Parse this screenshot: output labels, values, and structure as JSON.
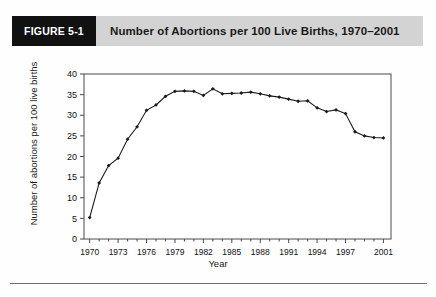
{
  "figure": {
    "tag": "FIGURE 5-1",
    "title": "Number of Abortions per 100 Live Births, 1970–2001",
    "tag_bg": "#111111",
    "banner_bg": "#d3d3d3"
  },
  "chart_data": {
    "type": "line",
    "title": "Number of Abortions per 100 Live Births, 1970–2001",
    "xlabel": "Year",
    "ylabel": "Number of abortions per 100 live births",
    "xlim": [
      1969.4,
      2001.8
    ],
    "ylim": [
      0,
      40
    ],
    "yticks": [
      0,
      5,
      10,
      15,
      20,
      25,
      30,
      35,
      40
    ],
    "ytick_labels": [
      "0",
      "5",
      "10",
      "15",
      "20",
      "25",
      "30",
      "35",
      "40"
    ],
    "xticks": [
      1970,
      1973,
      1976,
      1979,
      1982,
      1985,
      1988,
      1991,
      1994,
      1997,
      2001
    ],
    "xtick_labels": [
      "1970",
      "1973",
      "1976",
      "1979",
      "1982",
      "1985",
      "1988",
      "1991",
      "1994",
      "1997",
      "2001"
    ],
    "x_minor_tick_interval": 1,
    "grid": false,
    "legend": false,
    "marker": "diamond",
    "line_color": "#1a1a1a",
    "x": [
      1970,
      1971,
      1972,
      1973,
      1974,
      1975,
      1976,
      1977,
      1978,
      1979,
      1980,
      1981,
      1982,
      1983,
      1984,
      1985,
      1986,
      1987,
      1988,
      1989,
      1990,
      1991,
      1992,
      1993,
      1994,
      1995,
      1996,
      1997,
      1998,
      1999,
      2000,
      2001
    ],
    "values": [
      5.2,
      13.6,
      17.8,
      19.6,
      24.2,
      27.2,
      31.2,
      32.5,
      34.6,
      35.8,
      35.9,
      35.8,
      34.8,
      36.4,
      35.2,
      35.3,
      35.4,
      35.6,
      35.2,
      34.7,
      34.4,
      33.9,
      33.4,
      33.5,
      31.8,
      30.9,
      31.3,
      30.4,
      26.0,
      25.0,
      24.6,
      24.5
    ],
    "npoints": 32
  }
}
